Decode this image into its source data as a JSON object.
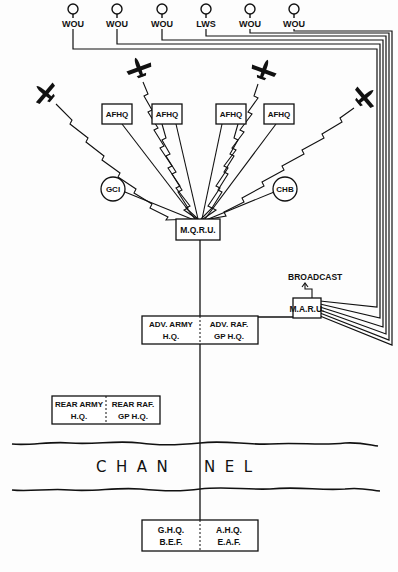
{
  "diagram": {
    "stations": [
      {
        "label": "WOU",
        "x": 73
      },
      {
        "label": "WOU",
        "x": 117
      },
      {
        "label": "WOU",
        "x": 162
      },
      {
        "label": "LWS",
        "x": 206
      },
      {
        "label": "WOU",
        "x": 250
      },
      {
        "label": "WOU",
        "x": 294
      }
    ],
    "afhq": [
      "AFHQ",
      "AFHQ",
      "AFHQ",
      "AFHQ"
    ],
    "circles": {
      "left": "GCI",
      "right": "CHB"
    },
    "mqru": "M.Q.R.U.",
    "maru": "M.A.R.U.",
    "broadcast": "BROADCAST",
    "adv": {
      "left_line1": "ADV. ARMY",
      "left_line2": "H.Q.",
      "right_line1": "ADV.  RAF.",
      "right_line2": "GP  H.Q."
    },
    "rear": {
      "left_line1": "REAR ARMY",
      "left_line2": "H.Q.",
      "right_line1": "REAR  RAF.",
      "right_line2": "GP  H.Q."
    },
    "channel_left": "C  H  A  N",
    "channel_right": "N  E  L",
    "ghq": {
      "left_line1": "G.H.Q.",
      "left_line2": "B.E.F.",
      "right_line1": "A.H.Q.",
      "right_line2": "E.A.F."
    },
    "ink": "#111111"
  }
}
